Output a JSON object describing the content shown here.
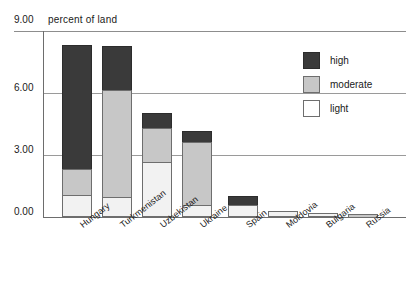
{
  "chart_data": {
    "type": "bar",
    "subtype": "stacked-bar",
    "title": "percent of land",
    "xlabel": "",
    "ylabel": "percent of land",
    "ylim": [
      0,
      9
    ],
    "ytick_labels": [
      "0.00",
      "3.00",
      "6.00",
      "9.00"
    ],
    "ytick_values": [
      0,
      3,
      6,
      9
    ],
    "grid": true,
    "legend_position": "upper-right",
    "categories": [
      "Hungary",
      "Turkmenistan",
      "Uzbekistan",
      "Ukraine",
      "Spain",
      "Moldovia",
      "Bulgaria",
      "Russia"
    ],
    "series": [
      {
        "name": "light",
        "color": "#f2f2f2",
        "values": [
          1.05,
          0.95,
          2.65,
          0.6,
          0.6,
          0.3,
          0.18,
          0.0
        ]
      },
      {
        "name": "moderate",
        "color": "#c7c7c7",
        "values": [
          1.25,
          5.2,
          1.65,
          3.05,
          0.0,
          0.0,
          0.0,
          0.15
        ]
      },
      {
        "name": "high",
        "color": "#3a3a3a",
        "values": [
          6.0,
          2.15,
          0.75,
          0.5,
          0.4,
          0.0,
          0.0,
          0.0
        ]
      }
    ],
    "totals": [
      8.3,
      8.3,
      5.05,
      4.15,
      1.0,
      0.3,
      0.18,
      0.15
    ]
  },
  "legend": {
    "items": [
      {
        "label": "high",
        "key": "high"
      },
      {
        "label": "moderate",
        "key": "moderate"
      },
      {
        "label": "light",
        "key": "light"
      }
    ]
  },
  "axis": {
    "top_value_label": "9.00",
    "title": "percent of land",
    "labels": [
      "6.00",
      "3.00",
      "0.00"
    ]
  }
}
